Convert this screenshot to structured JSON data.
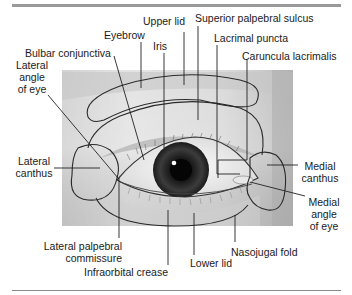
{
  "figure": {
    "labels": {
      "upper_lid": "Upper lid",
      "superior_palpebral_sulcus": "Superior palpebral sulcus",
      "eyebrow": "Eyebrow",
      "iris": "Iris",
      "lacrimal_puncta": "Lacrimal puncta",
      "bulbar_conjunctiva": "Bulbar conjunctiva",
      "caruncula_lacrimalis": "Caruncula lacrimalis",
      "lateral_angle_line1": "Lateral",
      "lateral_angle_line2": "angle",
      "lateral_angle_line3": "of eye",
      "lateral_canthus_line1": "Lateral",
      "lateral_canthus_line2": "canthus",
      "medial_canthus_line1": "Medial",
      "medial_canthus_line2": "canthus",
      "medial_angle_line1": "Medial",
      "medial_angle_line2": "angle",
      "medial_angle_line3": "of eye",
      "lateral_palpebral_line1": "Lateral palpebral",
      "lateral_palpebral_line2": "commissure",
      "infraorbital_crease": "Infraorbital crease",
      "lower_lid": "Lower lid",
      "nasojugal_fold": "Nasojugal fold"
    },
    "colors": {
      "rule": "#9a9a9a",
      "outline": "#2a2a2a",
      "leader": "#222222",
      "skin_light": "#e6e6e6",
      "skin_dark": "#b8b8b8",
      "iris": "#3a3a3a",
      "pupil": "#0a0a0a"
    }
  }
}
